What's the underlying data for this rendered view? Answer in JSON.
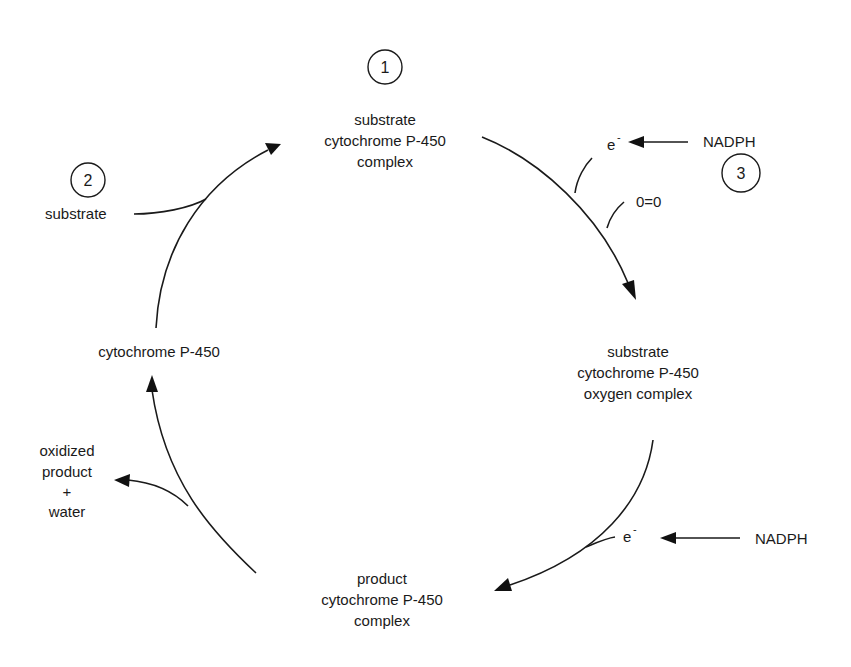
{
  "diagram": {
    "nodes": {
      "top": {
        "step": "1",
        "lines": [
          "substrate",
          "cytochrome P-450",
          "complex"
        ]
      },
      "right": {
        "lines": [
          "substrate",
          "cytochrome P-450",
          "oxygen complex"
        ]
      },
      "bottom": {
        "lines": [
          "product",
          "cytochrome P-450",
          "complex"
        ]
      },
      "left": {
        "lines": [
          "cytochrome P-450"
        ]
      }
    },
    "inputs": {
      "substrate": {
        "step": "2",
        "label": "substrate"
      },
      "electron_1": {
        "label": "e",
        "superscript": "-"
      },
      "nadph_1": {
        "step": "3",
        "label": "NADPH"
      },
      "oxygen": {
        "label": "0=0"
      },
      "electron_2": {
        "label": "e",
        "superscript": "-"
      },
      "nadph_2": {
        "label": "NADPH"
      }
    },
    "outputs": {
      "product": {
        "lines": [
          "oxidized",
          "product",
          "+",
          "water"
        ]
      }
    },
    "colors": {
      "ink": "#1a1a1a",
      "background": "#ffffff"
    }
  }
}
